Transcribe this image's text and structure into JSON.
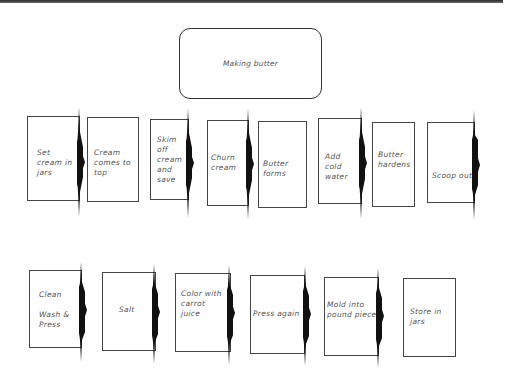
{
  "title": "Making butter",
  "colors": {
    "stroke": "#333333",
    "arrow": "#111111",
    "text": "#555555"
  },
  "row1": [
    {
      "label": "Set\ncream in\njars",
      "has_arrow": true
    },
    {
      "label": "Cream\ncomes to\ntop",
      "has_arrow": false
    },
    {
      "label": "Skim\noff\ncream\nand\nsave",
      "has_arrow": true
    },
    {
      "label": "Churn\ncream",
      "has_arrow": true
    },
    {
      "label": "Butter\nforms",
      "has_arrow": false
    },
    {
      "label": "Add\ncold\nwater",
      "has_arrow": true
    },
    {
      "label": "Butter\nhardens",
      "has_arrow": false
    },
    {
      "label": "Scoop out",
      "has_arrow": true
    }
  ],
  "row2": [
    {
      "label": "Clean\n\nWash &\nPress",
      "has_arrow": true
    },
    {
      "label": "Salt",
      "has_arrow": true
    },
    {
      "label": "Color with\ncarrot\njuice",
      "has_arrow": true
    },
    {
      "label": "Press again",
      "has_arrow": true
    },
    {
      "label": "Mold into\npound pieces",
      "has_arrow": true
    },
    {
      "label": "Store in\njars",
      "has_arrow": false
    }
  ]
}
